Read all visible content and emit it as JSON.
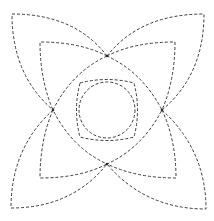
{
  "figure": {
    "stroke_color": "#3a3a3a",
    "background_color": "#ffffff",
    "line_style": "dashed",
    "petal_count_outer": 4,
    "petal_count_inner": 4,
    "central_shapes": [
      "circle",
      "rounded-square",
      "curved-diamond"
    ],
    "cardinal_vertices": [
      "top",
      "right",
      "bottom",
      "left"
    ]
  }
}
